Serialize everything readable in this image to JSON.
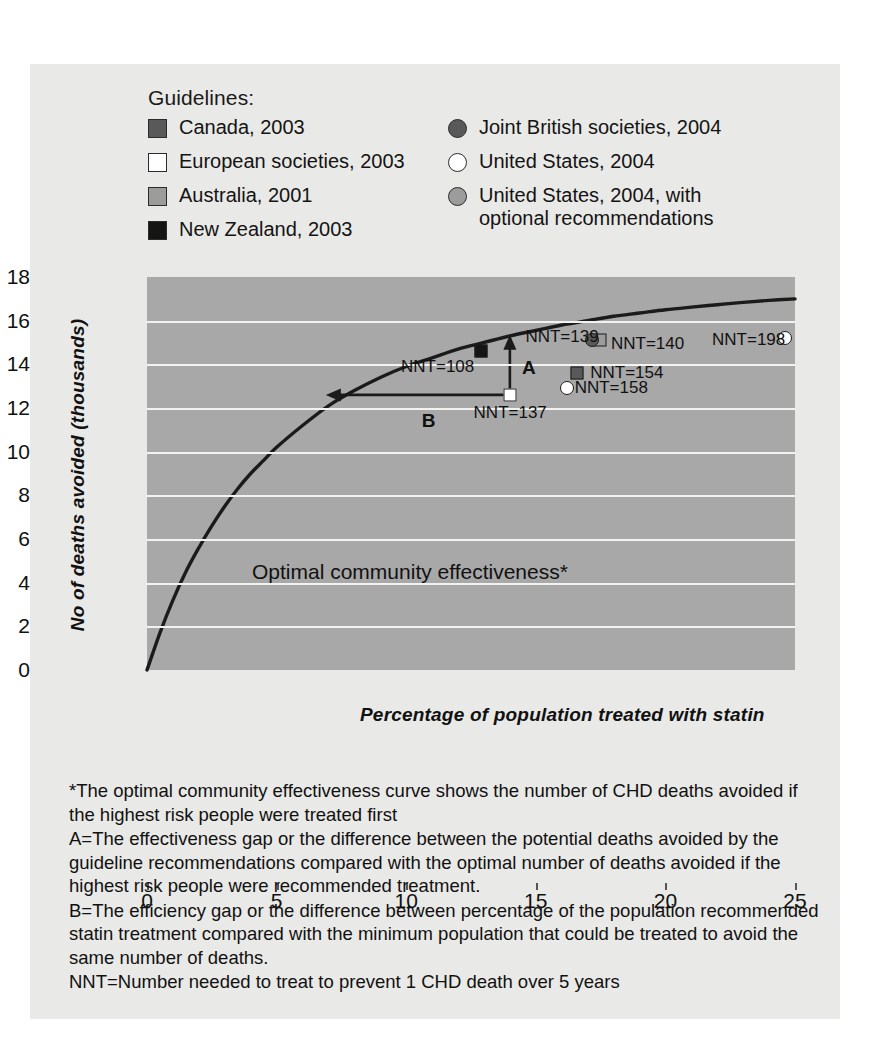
{
  "legend": {
    "title": "Guidelines:",
    "left_items": [
      {
        "label": "Canada, 2003",
        "marker": "square",
        "fill": "#595959"
      },
      {
        "label": "European societies, 2003",
        "marker": "square",
        "fill": "#ffffff"
      },
      {
        "label": "Australia, 2001",
        "marker": "square",
        "fill": "#9c9c9c"
      },
      {
        "label": "New Zealand, 2003",
        "marker": "square",
        "fill": "#151515"
      }
    ],
    "right_items": [
      {
        "label": "Joint British societies, 2004",
        "marker": "circle",
        "fill": "#595959"
      },
      {
        "label": "United States, 2004",
        "marker": "circle",
        "fill": "#ffffff"
      },
      {
        "label": "United States, 2004, with\noptional recommendations",
        "marker": "circle",
        "fill": "#9c9c9c"
      }
    ]
  },
  "chart_data": {
    "type": "scatter",
    "title": "",
    "xlabel": "Percentage of population treated with statin",
    "ylabel": "No of deaths avoided (thousands)",
    "xlim": [
      0,
      25
    ],
    "ylim": [
      0,
      18
    ],
    "xticks": [
      0,
      5,
      10,
      15,
      20,
      25
    ],
    "yticks": [
      0,
      2,
      4,
      6,
      8,
      10,
      12,
      14,
      16,
      18
    ],
    "grid": "horizontal",
    "legend_position": "top",
    "curve": {
      "name": "Optimal community effectiveness",
      "annotation": "Optimal community effectiveness*",
      "points": [
        [
          0,
          0
        ],
        [
          0.5,
          1.7
        ],
        [
          1,
          3.2
        ],
        [
          1.5,
          4.5
        ],
        [
          2,
          5.6
        ],
        [
          2.5,
          6.6
        ],
        [
          3,
          7.5
        ],
        [
          3.5,
          8.3
        ],
        [
          4,
          9.0
        ],
        [
          4.5,
          9.6
        ],
        [
          5,
          10.2
        ],
        [
          6,
          11.2
        ],
        [
          7,
          12.1
        ],
        [
          8,
          12.8
        ],
        [
          9,
          13.4
        ],
        [
          10,
          13.9
        ],
        [
          11,
          14.3
        ],
        [
          12,
          14.7
        ],
        [
          13,
          15.0
        ],
        [
          14,
          15.3
        ],
        [
          15,
          15.55
        ],
        [
          16,
          15.8
        ],
        [
          17,
          16.0
        ],
        [
          18,
          16.2
        ],
        [
          19,
          16.35
        ],
        [
          20,
          16.5
        ],
        [
          21,
          16.62
        ],
        [
          22,
          16.73
        ],
        [
          23,
          16.84
        ],
        [
          24,
          16.93
        ],
        [
          25,
          17.0
        ]
      ]
    },
    "points": [
      {
        "label": "NNT=108",
        "x": 12.9,
        "y": 14.6,
        "marker": "square",
        "fill": "#151515",
        "series": "New Zealand, 2003"
      },
      {
        "label": "NNT=137",
        "x": 14.0,
        "y": 12.6,
        "marker": "square",
        "fill": "#ffffff",
        "series": "European societies, 2003"
      },
      {
        "label": "NNT=139",
        "x": 17.3,
        "y": 15.1,
        "marker": "circle-square",
        "fill": "#595959",
        "series": "Joint British societies, 2004 / Australia, 2001"
      },
      {
        "label": "NNT=140",
        "x": 19.5,
        "y": 15.1,
        "marker": "none",
        "fill": "",
        "series": ""
      },
      {
        "label": "NNT=154",
        "x": 16.6,
        "y": 13.6,
        "marker": "square",
        "fill": "#595959",
        "series": "Canada, 2003"
      },
      {
        "label": "NNT=158",
        "x": 16.2,
        "y": 12.9,
        "marker": "circle",
        "fill": "#ffffff",
        "series": "United States, 2004"
      },
      {
        "label": "NNT=198",
        "x": 24.6,
        "y": 15.2,
        "marker": "circle",
        "fill": "#ffffff",
        "series": "United States, 2004"
      }
    ],
    "annotations": [
      {
        "id": "A",
        "label": "A",
        "type": "vertical-arrow",
        "x": 14.0,
        "y_from": 12.6,
        "y_to": 15.35
      },
      {
        "id": "B",
        "label": "B",
        "type": "horizontal-arrow",
        "y": 12.6,
        "x_from": 14.0,
        "x_to": 6.9
      }
    ]
  },
  "footnotes": [
    "*The optimal community effectiveness curve shows the number of CHD deaths avoided if the highest risk people were treated first",
    "A=The effectiveness gap or the difference between the potential deaths avoided by the guideline recommendations compared with the optimal number of deaths avoided if the highest risk people were recommended treatment.",
    "B=The efficiency gap or the difference between percentage of the population recommended statin treatment compared with the minimum population that could be treated to avoid the same number of deaths.",
    "NNT=Number needed to treat to prevent 1 CHD death over 5 years"
  ]
}
